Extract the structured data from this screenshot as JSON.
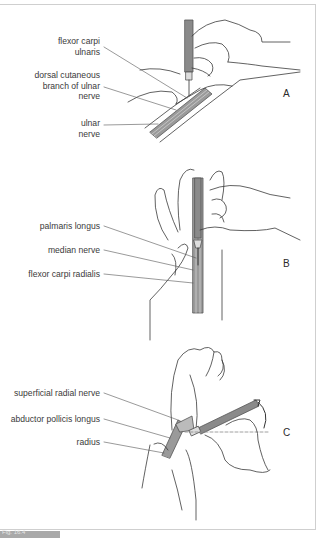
{
  "figure": {
    "caption_tab": "Fig. 16.4",
    "panels": [
      {
        "id": "A",
        "letter": "A",
        "labels": [
          {
            "line1": "flexor carpi",
            "line2": "ulnaris"
          },
          {
            "line1": "dorsal cutaneous",
            "line2": "branch of ulnar",
            "line3": "nerve"
          },
          {
            "line1": "ulnar",
            "line2": "nerve"
          }
        ]
      },
      {
        "id": "B",
        "letter": "B",
        "labels": [
          {
            "line1": "palmaris longus"
          },
          {
            "line1": "median nerve"
          },
          {
            "line1": "flexor carpi radialis"
          }
        ]
      },
      {
        "id": "C",
        "letter": "C",
        "labels": [
          {
            "line1": "superficial radial nerve"
          },
          {
            "line1": "abductor pollicis longus"
          },
          {
            "line1": "radius"
          }
        ]
      }
    ]
  },
  "colors": {
    "line": "#3a3a3a",
    "tool": "#8a8a8a",
    "frame": "#cfcfcf",
    "tab": "#a9a9a9"
  }
}
